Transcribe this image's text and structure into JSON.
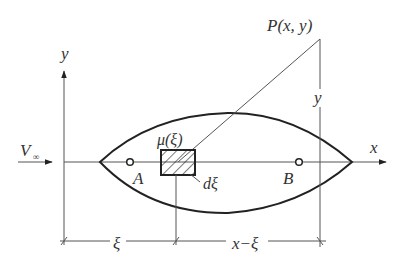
{
  "diagram": {
    "colors": {
      "line": "#555555",
      "body_outline": "#222222",
      "text": "#333333",
      "background": "#ffffff"
    },
    "labels": {
      "point_p": "P(x, y)",
      "y_axis": "y",
      "x_axis": "x",
      "y_dimension": "y",
      "freestream": "V",
      "freestream_sub": "∞",
      "source_strength": "μ(ξ)",
      "point_a": "A",
      "point_b": "B",
      "element_width": "dξ",
      "dim_xi": "ξ",
      "dim_x_minus_xi": "x−ξ"
    }
  }
}
